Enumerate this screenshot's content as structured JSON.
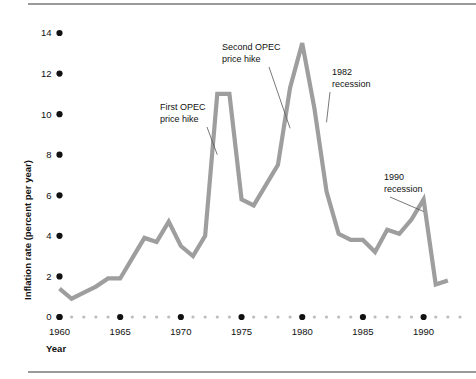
{
  "figure": {
    "background_color": "#ffffff",
    "line_color": "#9e9e9e",
    "text_color": "#111111",
    "rule_color": "#9a9a9a"
  },
  "axes": {
    "x_title": "Year",
    "y_title": "Inflation rate (percent per year)"
  },
  "chart_data": {
    "type": "line",
    "title": "",
    "xlabel": "Year",
    "ylabel": "Inflation rate (percent per year)",
    "xlim": [
      1960,
      1993
    ],
    "ylim": [
      0,
      15
    ],
    "grid": false,
    "legend": "none",
    "x_major_ticks": [
      1960,
      1965,
      1970,
      1975,
      1980,
      1985,
      1990
    ],
    "x_tick_labels": [
      "1960",
      "1965",
      "1970",
      "1975",
      "1980",
      "1985",
      "1990"
    ],
    "x_minor_ticks": [
      1961,
      1962,
      1963,
      1964,
      1966,
      1967,
      1968,
      1969,
      1971,
      1972,
      1973,
      1974,
      1976,
      1977,
      1978,
      1979,
      1981,
      1982,
      1983,
      1984,
      1986,
      1987,
      1988,
      1989,
      1991,
      1992,
      1993
    ],
    "y_ticks": [
      0,
      2,
      4,
      6,
      8,
      10,
      12,
      14
    ],
    "y_tick_labels": [
      "0",
      "2",
      "4",
      "6",
      "8",
      "10",
      "12",
      "14"
    ],
    "series": [
      {
        "name": "Inflation rate",
        "x": [
          1960,
          1961,
          1962,
          1963,
          1964,
          1965,
          1966,
          1967,
          1968,
          1969,
          1970,
          1971,
          1972,
          1973,
          1974,
          1975,
          1976,
          1977,
          1978,
          1979,
          1980,
          1981,
          1982,
          1983,
          1984,
          1985,
          1986,
          1987,
          1988,
          1989,
          1990,
          1991,
          1992
        ],
        "values": [
          1.4,
          0.9,
          1.2,
          1.5,
          1.9,
          1.9,
          2.9,
          3.9,
          3.7,
          4.7,
          3.5,
          3.0,
          4.0,
          11.0,
          11.0,
          5.8,
          5.5,
          6.5,
          7.5,
          11.3,
          13.5,
          10.3,
          6.2,
          4.1,
          3.8,
          3.8,
          3.2,
          4.3,
          4.1,
          4.8,
          5.8,
          1.6,
          1.8
        ]
      }
    ],
    "annotations": [
      {
        "id": "first-opec",
        "lines": [
          "First OPEC",
          "price hike"
        ],
        "target_x": 1973,
        "target_y": 8.0
      },
      {
        "id": "second-opec",
        "lines": [
          "Second OPEC",
          "price hike"
        ],
        "target_x": 1979,
        "target_y": 9.3
      },
      {
        "id": "recession-1982",
        "lines": [
          "1982",
          "recession"
        ],
        "target_x": 1982,
        "target_y": 9.6
      },
      {
        "id": "recession-1990",
        "lines": [
          "1990",
          "recession"
        ],
        "target_x": 1990,
        "target_y": 5.2
      }
    ]
  }
}
